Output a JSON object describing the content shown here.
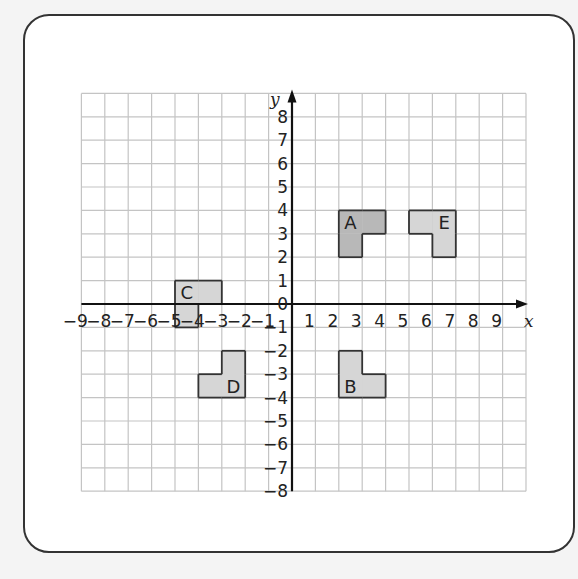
{
  "diagram": {
    "type": "coordinate-grid",
    "axes": {
      "x_label": "x",
      "y_label": "y"
    },
    "x_range": [
      -9,
      10
    ],
    "y_range": [
      -8,
      9
    ],
    "x_ticks": [
      -9,
      -8,
      -7,
      -6,
      -5,
      -4,
      -3,
      -2,
      -1,
      1,
      2,
      3,
      4,
      5,
      6,
      7,
      8,
      9
    ],
    "y_ticks": [
      8,
      7,
      6,
      5,
      4,
      3,
      2,
      1,
      0,
      -1,
      -2,
      -3,
      -4,
      -5,
      -6,
      -7,
      -8
    ],
    "colors": {
      "shape_fill": "#d6d6d6",
      "highlight_fill": "#b8b8b8",
      "outline": "#333333",
      "grid": "#c4c4c4"
    },
    "shapes": [
      {
        "label": "A",
        "highlight": true,
        "cells": [
          [
            2,
            3
          ],
          [
            3,
            3
          ],
          [
            2,
            2
          ]
        ],
        "label_pos": [
          2.5,
          3.5
        ]
      },
      {
        "label": "B",
        "highlight": false,
        "cells": [
          [
            2,
            -3
          ],
          [
            2,
            -4
          ],
          [
            3,
            -4
          ]
        ],
        "label_pos": [
          2.5,
          -3.5
        ]
      },
      {
        "label": "C",
        "highlight": false,
        "cells": [
          [
            -5,
            0
          ],
          [
            -4,
            0
          ],
          [
            -5,
            -1
          ]
        ],
        "label_pos": [
          -4.5,
          0.5
        ]
      },
      {
        "label": "D",
        "highlight": false,
        "cells": [
          [
            -3,
            -3
          ],
          [
            -4,
            -4
          ],
          [
            -3,
            -4
          ]
        ],
        "label_pos": [
          -2.5,
          -3.5
        ]
      },
      {
        "label": "E",
        "highlight": false,
        "cells": [
          [
            5,
            3
          ],
          [
            6,
            3
          ],
          [
            6,
            2
          ]
        ],
        "label_pos": [
          6.5,
          3.5
        ]
      }
    ]
  }
}
